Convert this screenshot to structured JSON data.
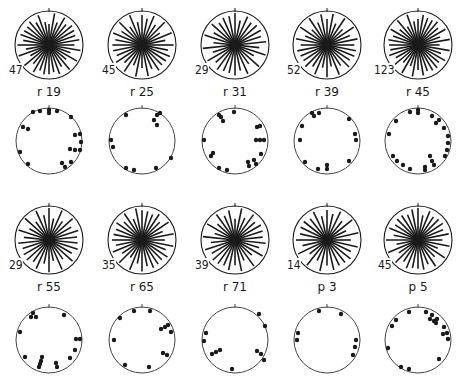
{
  "figure": {
    "ink_color": "#1a1a1a",
    "panels": [
      {
        "label": "r 19",
        "count": "47",
        "rose": {
          "cx": 49,
          "cy": 45,
          "r": 34,
          "spokes": 36,
          "bias": "uniform"
        },
        "dots": {
          "cx": 49,
          "cy": 141,
          "r": 33,
          "points": [
            [
              -16,
              -29
            ],
            [
              -9,
              -30
            ],
            [
              0,
              -31
            ],
            [
              0,
              -28
            ],
            [
              8,
              -30
            ],
            [
              22,
              -24
            ],
            [
              -26,
              -14
            ],
            [
              -21,
              -12
            ],
            [
              26,
              -6
            ],
            [
              31,
              -7
            ],
            [
              32,
              1
            ],
            [
              21,
              8
            ],
            [
              26,
              9
            ],
            [
              31,
              9
            ],
            [
              -29,
              11
            ],
            [
              -21,
              23
            ],
            [
              13,
              22
            ],
            [
              16,
              26
            ],
            [
              22,
              21
            ]
          ]
        }
      },
      {
        "label": "r 25",
        "count": "45",
        "rose": {
          "cx": 142,
          "cy": 45,
          "r": 34,
          "spokes": 32,
          "bias": "uniform"
        },
        "dots": {
          "cx": 142,
          "cy": 141,
          "r": 33,
          "points": [
            [
              -16,
              -26
            ],
            [
              15,
              -26
            ],
            [
              12,
              -21
            ],
            [
              15,
              -16
            ],
            [
              18,
              -28
            ],
            [
              -31,
              -1
            ],
            [
              -29,
              6
            ],
            [
              -16,
              27
            ],
            [
              -8,
              29
            ],
            [
              14,
              27
            ],
            [
              29,
              17
            ]
          ]
        }
      },
      {
        "label": "r 31",
        "count": "29",
        "rose": {
          "cx": 235,
          "cy": 45,
          "r": 34,
          "spokes": 30,
          "bias": "uniform"
        },
        "dots": {
          "cx": 235,
          "cy": 141,
          "r": 33,
          "points": [
            [
              -1,
              -29
            ],
            [
              -16,
              -26
            ],
            [
              -14,
              -24
            ],
            [
              -12,
              -20
            ],
            [
              22,
              -14
            ],
            [
              25,
              -15
            ],
            [
              -31,
              -1
            ],
            [
              21,
              -1
            ],
            [
              25,
              -1
            ],
            [
              29,
              -1
            ],
            [
              -22,
              12
            ],
            [
              -24,
              15
            ],
            [
              -16,
              27
            ],
            [
              -8,
              29
            ],
            [
              13,
              21
            ],
            [
              19,
              19
            ],
            [
              14,
              25
            ],
            [
              21,
              23
            ],
            [
              26,
              13
            ]
          ]
        }
      },
      {
        "label": "r 39",
        "count": "52",
        "rose": {
          "cx": 327,
          "cy": 45,
          "r": 34,
          "spokes": 32,
          "bias": "uniform"
        },
        "dots": {
          "cx": 327,
          "cy": 141,
          "r": 33,
          "points": [
            [
              -15,
              -28
            ],
            [
              -13,
              -25
            ],
            [
              -8,
              -28
            ],
            [
              -25,
              -15
            ],
            [
              -27,
              -1
            ],
            [
              22,
              -22
            ],
            [
              28,
              -7
            ],
            [
              29,
              -1
            ],
            [
              22,
              20
            ],
            [
              -22,
              21
            ],
            [
              -9,
              28
            ],
            [
              0,
              24
            ],
            [
              0,
              28
            ]
          ]
        }
      },
      {
        "label": "r 45",
        "count": "123",
        "rose": {
          "cx": 418,
          "cy": 45,
          "r": 34,
          "spokes": 36,
          "bias": "uniform"
        },
        "dots": {
          "cx": 418,
          "cy": 141,
          "r": 33,
          "points": [
            [
              -8,
              -29
            ],
            [
              0,
              -31
            ],
            [
              0,
              -28
            ],
            [
              14,
              -25
            ],
            [
              21,
              -21
            ],
            [
              18,
              -18
            ],
            [
              26,
              -13
            ],
            [
              30,
              -5
            ],
            [
              30,
              2
            ],
            [
              29,
              9
            ],
            [
              27,
              15
            ],
            [
              -22,
              -20
            ],
            [
              -29,
              -7
            ],
            [
              -25,
              15
            ],
            [
              -21,
              20
            ],
            [
              -15,
              24
            ],
            [
              -8,
              28
            ],
            [
              12,
              15
            ],
            [
              14,
              20
            ],
            [
              16,
              24
            ],
            [
              7,
              26
            ],
            [
              7,
              29
            ]
          ]
        }
      },
      {
        "label": "r 55",
        "count": "29",
        "rose": {
          "cx": 49,
          "cy": 240,
          "r": 34,
          "spokes": 30,
          "bias": "uniform"
        },
        "dots": {
          "cx": 49,
          "cy": 340,
          "r": 33,
          "points": [
            [
              -16,
              -27
            ],
            [
              -18,
              -23
            ],
            [
              -13,
              -23
            ],
            [
              15,
              -25
            ],
            [
              -29,
              -8
            ],
            [
              27,
              -1
            ],
            [
              31,
              -1
            ],
            [
              -24,
              17
            ],
            [
              -7,
              17
            ],
            [
              -8,
              21
            ],
            [
              -9,
              24
            ],
            [
              -10,
              27
            ],
            [
              7,
              23
            ],
            [
              8,
              27
            ],
            [
              21,
              18
            ],
            [
              26,
              10
            ]
          ]
        }
      },
      {
        "label": "r 65",
        "count": "35",
        "rose": {
          "cx": 142,
          "cy": 240,
          "r": 34,
          "spokes": 32,
          "bias": "uniform"
        },
        "dots": {
          "cx": 142,
          "cy": 340,
          "r": 33,
          "points": [
            [
              -8,
              -29
            ],
            [
              8,
              -29
            ],
            [
              -22,
              -22
            ],
            [
              19,
              -11
            ],
            [
              23,
              -13
            ],
            [
              26,
              -15
            ],
            [
              29,
              -8
            ],
            [
              -28,
              0
            ],
            [
              21,
              13
            ],
            [
              25,
              15
            ],
            [
              -17,
              25
            ],
            [
              7,
              27
            ]
          ]
        }
      },
      {
        "label": "r 71",
        "count": "39",
        "rose": {
          "cx": 235,
          "cy": 240,
          "r": 34,
          "spokes": 30,
          "bias": "uniform"
        },
        "dots": {
          "cx": 235,
          "cy": 340,
          "r": 33,
          "points": [
            [
              -29,
              -7
            ],
            [
              -31,
              1
            ],
            [
              -23,
              14
            ],
            [
              -19,
              12
            ],
            [
              -15,
              10
            ],
            [
              24,
              -26
            ],
            [
              30,
              -14
            ],
            [
              -3,
              29
            ],
            [
              22,
              11
            ],
            [
              26,
              14
            ],
            [
              29,
              20
            ]
          ]
        }
      },
      {
        "label": "p 3",
        "count": "14",
        "rose": {
          "cx": 327,
          "cy": 240,
          "r": 34,
          "spokes": 28,
          "bias": "uniform"
        },
        "dots": {
          "cx": 327,
          "cy": 340,
          "r": 33,
          "points": [
            [
              -8,
              -29
            ],
            [
              14,
              -26
            ],
            [
              -29,
              -7
            ],
            [
              -30,
              0
            ],
            [
              29,
              0
            ],
            [
              28,
              7
            ],
            [
              26,
              15
            ]
          ]
        }
      },
      {
        "label": "p 5",
        "count": "45",
        "rose": {
          "cx": 418,
          "cy": 240,
          "r": 34,
          "spokes": 32,
          "bias": "uniform"
        },
        "dots": {
          "cx": 418,
          "cy": 340,
          "r": 33,
          "points": [
            [
              -9,
              -28
            ],
            [
              8,
              -28
            ],
            [
              14,
              -25
            ],
            [
              12,
              -21
            ],
            [
              16,
              -19
            ],
            [
              19,
              -21
            ],
            [
              18,
              -17
            ],
            [
              26,
              -13
            ],
            [
              29,
              -7
            ],
            [
              25,
              -6
            ],
            [
              30,
              -1
            ],
            [
              -22,
              -20
            ],
            [
              -26,
              -14
            ],
            [
              -30,
              8
            ],
            [
              -17,
              27
            ],
            [
              -9,
              29
            ],
            [
              21,
              19
            ]
          ]
        }
      }
    ]
  }
}
